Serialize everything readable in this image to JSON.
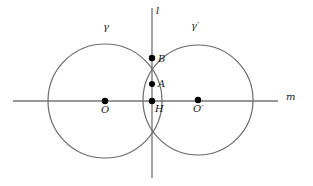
{
  "figure": {
    "type": "geometry-diagram",
    "background_color": "#ffffff",
    "stroke_color": "#6b6b6b",
    "point_color": "#000000",
    "label_color": "#1a1a1a",
    "width": 313,
    "height": 186
  },
  "labels": {
    "gamma": "γ",
    "gamma_prime": "γ′",
    "line_l": "l",
    "line_m": "m",
    "point_B": "B",
    "point_A": "A",
    "point_H": "H",
    "point_O": "O",
    "point_O_prime": "O′"
  },
  "geometry": {
    "circles": [
      {
        "name": "gamma",
        "cx": 105,
        "cy": 101,
        "r": 57
      },
      {
        "name": "gamma-prime",
        "cx": 198,
        "cy": 100,
        "r": 55
      }
    ],
    "lines": [
      {
        "name": "line-l",
        "x1": 152,
        "y1": 8,
        "x2": 152,
        "y2": 178
      },
      {
        "name": "line-m",
        "x1": 13,
        "y1": 101,
        "x2": 278,
        "y2": 101
      }
    ],
    "points": [
      {
        "name": "B",
        "x": 152,
        "y": 58,
        "r": 3.2
      },
      {
        "name": "A",
        "x": 152,
        "y": 84,
        "r": 3.0
      },
      {
        "name": "H",
        "x": 152,
        "y": 101,
        "r": 3.2
      },
      {
        "name": "O",
        "x": 105,
        "y": 101,
        "r": 3.2
      },
      {
        "name": "O-prime",
        "x": 198,
        "y": 100,
        "r": 3.2
      }
    ],
    "label_positions": {
      "gamma": {
        "x": 103,
        "y": 22
      },
      "gamma_prime": {
        "x": 191,
        "y": 21
      },
      "line_l": {
        "x": 156,
        "y": 6
      },
      "line_m": {
        "x": 286,
        "y": 92
      },
      "point_B": {
        "x": 158,
        "y": 54
      },
      "point_A": {
        "x": 158,
        "y": 79
      },
      "point_H": {
        "x": 155,
        "y": 104
      },
      "point_O": {
        "x": 101,
        "y": 105
      },
      "point_O_prime": {
        "x": 193,
        "y": 104
      }
    }
  }
}
